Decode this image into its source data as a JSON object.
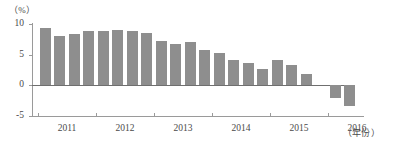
{
  "chart_data": {
    "type": "bar",
    "title": "",
    "xlabel": "年份",
    "ylabel": "%",
    "ylim": [
      -5,
      10
    ],
    "yticks": [
      10,
      5,
      0,
      -5
    ],
    "ytick_labels": [
      "10",
      "5",
      "0",
      "-5"
    ],
    "xtick_labels": [
      "2011",
      "2012",
      "2013",
      "2014",
      "2015",
      "2016"
    ],
    "grid": false,
    "legend": null,
    "bar_color": "#8e8e8e",
    "axis_color": "#9a9a9a",
    "categories": [
      "2011Q1",
      "2011Q2",
      "2011Q3",
      "2011Q4",
      "2012Q1",
      "2012Q2",
      "2012Q3",
      "2012Q4",
      "2013Q1",
      "2013Q2",
      "2013Q3",
      "2013Q4",
      "2014Q1",
      "2014Q2",
      "2014Q3",
      "2014Q4",
      "2015Q1",
      "2015Q2",
      "2015Q3",
      "2015Q4",
      "2016Q1",
      "2016Q2"
    ],
    "values": [
      9.3,
      8.0,
      8.3,
      8.8,
      8.8,
      9.0,
      8.9,
      8.5,
      7.2,
      6.8,
      7.0,
      5.8,
      5.2,
      4.2,
      3.6,
      2.7,
      4.2,
      3.3,
      1.9,
      0.0,
      -2.0,
      -3.4
    ]
  },
  "labels": {
    "y_unit": "（%）",
    "x_unit": "（年份）"
  }
}
